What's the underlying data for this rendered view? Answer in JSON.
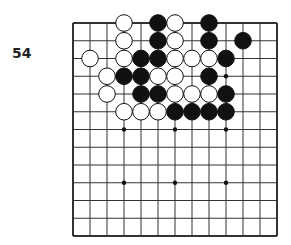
{
  "problem": {
    "number": "54"
  },
  "board": {
    "cols": 13,
    "rows": 13,
    "origin": [
      73,
      23
    ],
    "dx": 17,
    "dy": 17.75,
    "line_color": "#333333",
    "star_points": [
      [
        9,
        3
      ],
      [
        3,
        6
      ],
      [
        6,
        6
      ],
      [
        9,
        6
      ],
      [
        3,
        9
      ],
      [
        6,
        9
      ],
      [
        9,
        9
      ]
    ],
    "stones": [
      {
        "c": 3,
        "r": 0,
        "color": "white"
      },
      {
        "c": 5,
        "r": 0,
        "color": "black"
      },
      {
        "c": 6,
        "r": 0,
        "color": "white"
      },
      {
        "c": 8,
        "r": 0,
        "color": "black"
      },
      {
        "c": 3,
        "r": 1,
        "color": "white"
      },
      {
        "c": 5,
        "r": 1,
        "color": "black"
      },
      {
        "c": 6,
        "r": 1,
        "color": "white"
      },
      {
        "c": 8,
        "r": 1,
        "color": "black"
      },
      {
        "c": 10,
        "r": 1,
        "color": "black"
      },
      {
        "c": 1,
        "r": 2,
        "color": "white"
      },
      {
        "c": 3,
        "r": 2,
        "color": "white"
      },
      {
        "c": 4,
        "r": 2,
        "color": "black"
      },
      {
        "c": 5,
        "r": 2,
        "color": "black"
      },
      {
        "c": 6,
        "r": 2,
        "color": "white"
      },
      {
        "c": 7,
        "r": 2,
        "color": "white"
      },
      {
        "c": 8,
        "r": 2,
        "color": "white"
      },
      {
        "c": 9,
        "r": 2,
        "color": "black"
      },
      {
        "c": 2,
        "r": 3,
        "color": "white"
      },
      {
        "c": 3,
        "r": 3,
        "color": "black"
      },
      {
        "c": 4,
        "r": 3,
        "color": "black"
      },
      {
        "c": 5,
        "r": 3,
        "color": "white"
      },
      {
        "c": 6,
        "r": 3,
        "color": "white"
      },
      {
        "c": 8,
        "r": 3,
        "color": "black"
      },
      {
        "c": 2,
        "r": 4,
        "color": "white"
      },
      {
        "c": 4,
        "r": 4,
        "color": "black"
      },
      {
        "c": 5,
        "r": 4,
        "color": "black"
      },
      {
        "c": 6,
        "r": 4,
        "color": "white"
      },
      {
        "c": 7,
        "r": 4,
        "color": "white"
      },
      {
        "c": 8,
        "r": 4,
        "color": "white"
      },
      {
        "c": 9,
        "r": 4,
        "color": "black"
      },
      {
        "c": 3,
        "r": 5,
        "color": "white"
      },
      {
        "c": 4,
        "r": 5,
        "color": "white"
      },
      {
        "c": 5,
        "r": 5,
        "color": "white"
      },
      {
        "c": 6,
        "r": 5,
        "color": "black"
      },
      {
        "c": 7,
        "r": 5,
        "color": "black"
      },
      {
        "c": 8,
        "r": 5,
        "color": "black"
      },
      {
        "c": 9,
        "r": 5,
        "color": "black"
      }
    ]
  }
}
